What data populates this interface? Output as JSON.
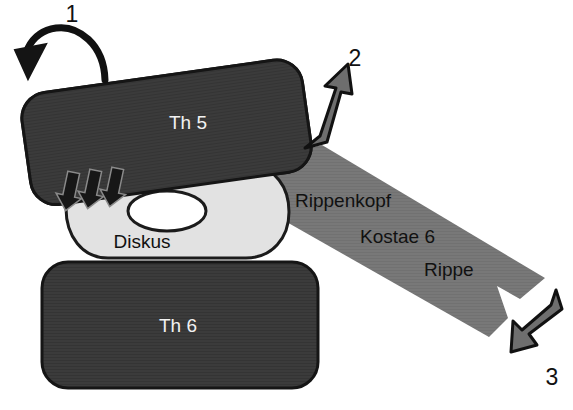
{
  "figure": {
    "type": "anatomical-diagram",
    "background_color": "#ffffff",
    "description_labels": {
      "vertebra_upper": "Th 5",
      "vertebra_lower": "Th 6",
      "disk": "Diskus",
      "rib_head": "Rippenkopf",
      "costa": "Kostae 6",
      "rib": "Rippe"
    },
    "callout_numbers": {
      "one": "1",
      "two": "2",
      "three": "3"
    },
    "colors": {
      "vertebra_fill": "#3b3b3b",
      "vertebra_outline": "#1a1a1a",
      "disk_fill": "#e2e2e2",
      "disk_outline": "#1a1a1a",
      "disk_center_fill": "#ffffff",
      "rib_fill": "#787878",
      "arrow_gray_fill": "#6e6e6e",
      "arrow_outline": "#111111",
      "arrow_black_fill": "#1a1a1a",
      "label_light": "#f2f2f2",
      "label_dark": "#111111"
    }
  }
}
